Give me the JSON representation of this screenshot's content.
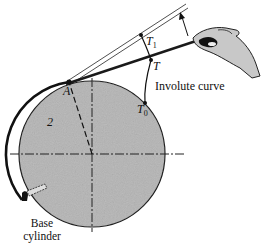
{
  "figure": {
    "labels": {
      "point_a": "A",
      "point_t": "T",
      "point_t1": "T",
      "point_t1_sub": "1",
      "point_t0": "T",
      "point_t0_sub": "0",
      "radius_label": "2",
      "involute_curve": "Involute curve",
      "base_cylinder_line1": "Base",
      "base_cylinder_line2": "cylinder"
    },
    "colors": {
      "cylinder_fill": "#b4b4b4",
      "line": "#1a1a1a",
      "hand_fill": "#c8c8c8",
      "background": "#ffffff"
    }
  }
}
